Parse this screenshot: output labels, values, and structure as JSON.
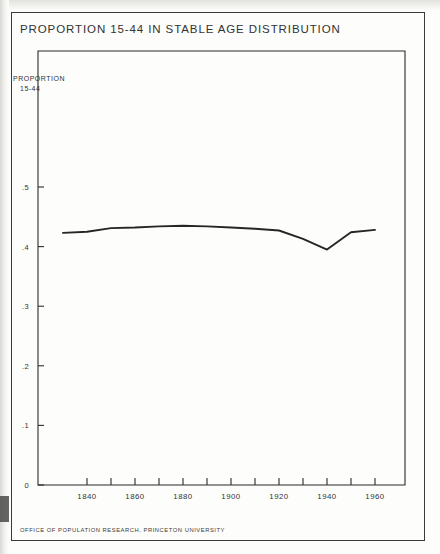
{
  "page": {
    "title": "PROPORTION 15-44 IN STABLE AGE DISTRIBUTION",
    "footer": "OFFICE OF POPULATION RESEARCH, PRINCETON UNIVERSITY",
    "y_axis_title_line1": "PROPORTION",
    "y_axis_title_line2": "15-44",
    "ink_color": "#2b2b2b",
    "paper_color": "#fdfdfb"
  },
  "chart_data": {
    "type": "line",
    "title": "PROPORTION 15-44 IN STABLE AGE DISTRIBUTION",
    "subtitle": "",
    "xlabel": "",
    "ylabel": "PROPORTION 15-44",
    "xlim": [
      1830,
      1965
    ],
    "ylim": [
      0,
      0.55
    ],
    "grid": false,
    "legend": null,
    "x_tick_labels": [
      "1840",
      "1860",
      "1880",
      "1900",
      "1920",
      "1940",
      "1960"
    ],
    "x_tick_label_values": [
      1840,
      1860,
      1880,
      1900,
      1920,
      1940,
      1960
    ],
    "x_minor_ticks": [
      1830,
      1840,
      1850,
      1860,
      1870,
      1880,
      1890,
      1900,
      1910,
      1920,
      1930,
      1940,
      1950,
      1960
    ],
    "y_tick_labels": [
      "0",
      ".1",
      ".2",
      ".3",
      ".4",
      ".5"
    ],
    "y_tick_values": [
      0,
      0.1,
      0.2,
      0.3,
      0.4,
      0.5
    ],
    "series": [
      {
        "name": "Proportion 15-44 in stable age distribution",
        "x": [
          1830,
          1840,
          1850,
          1860,
          1870,
          1880,
          1890,
          1900,
          1910,
          1920,
          1930,
          1940,
          1950,
          1960
        ],
        "values": [
          0.423,
          0.425,
          0.431,
          0.432,
          0.434,
          0.435,
          0.434,
          0.432,
          0.43,
          0.427,
          0.413,
          0.395,
          0.424,
          0.428
        ]
      }
    ],
    "annotations": [
      "Curve is nearly flat near 0.43 from 1830 to 1920",
      "Minimum near 0.395 at 1940",
      "Recovery to about 0.428 by 1960"
    ]
  }
}
